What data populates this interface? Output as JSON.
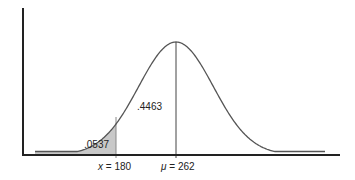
{
  "chart_data": {
    "type": "area",
    "title": "",
    "distribution": {
      "mean": 262,
      "z_at_x": -1.61
    },
    "x_markers": [
      {
        "var": "x",
        "value": 180,
        "label": "x = 180"
      },
      {
        "var": "μ",
        "value": 262,
        "label": "μ = 262"
      }
    ],
    "areas": [
      {
        "region": "left tail (x < 180)",
        "value": ".0537",
        "shaded": true
      },
      {
        "region": "180 < x < 262",
        "value": ".4463",
        "shaded": false
      }
    ],
    "xlabel": "",
    "ylabel": "",
    "grid": false,
    "legend": null,
    "colors": {
      "curve": "#555555",
      "shade": "#c8c8c8",
      "axis": "#222222"
    }
  },
  "labels": {
    "tail_area": ".0537",
    "middle_area": ".4463",
    "x_var": "x",
    "x_eq": " = 180",
    "mu_var": "μ",
    "mu_eq": " = 262"
  }
}
